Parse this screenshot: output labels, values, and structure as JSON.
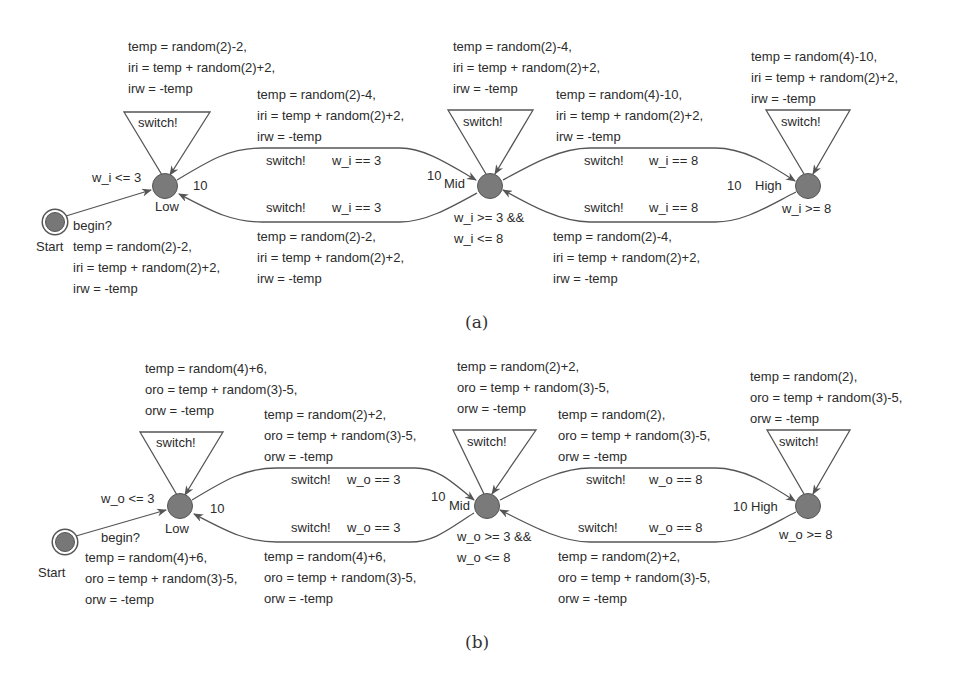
{
  "figure_a": {
    "caption": "(a)",
    "locations": {
      "start": {
        "name": "Start"
      },
      "low": {
        "name": "Low",
        "invariant": "w_i <= 3",
        "rate": "10"
      },
      "mid": {
        "name": "Mid",
        "invariant_1": "w_i >= 3 &&",
        "invariant_2": "w_i <= 8",
        "rate": "10"
      },
      "high": {
        "name": "High",
        "invariant": "w_i >= 8",
        "rate": "10"
      }
    },
    "edges": {
      "start_low": {
        "sync": "begin?",
        "u1": "temp = random(2)-2,",
        "u2": "iri = temp + random(2)+2,",
        "u3": "irw = -temp"
      },
      "low_self": {
        "sync": "switch!",
        "u1": "temp = random(2)-2,",
        "u2": "iri = temp + random(2)+2,",
        "u3": "irw = -temp"
      },
      "low_mid": {
        "sync": "switch!",
        "guard": "w_i == 3",
        "u1": "temp = random(2)-4,",
        "u2": "iri = temp + random(2)+2,",
        "u3": "irw = -temp"
      },
      "mid_low": {
        "sync": "switch!",
        "guard": "w_i == 3",
        "u1": "temp = random(2)-2,",
        "u2": "iri = temp + random(2)+2,",
        "u3": "irw = -temp"
      },
      "mid_self": {
        "sync": "switch!",
        "u1": "temp = random(2)-4,",
        "u2": "iri = temp + random(2)+2,",
        "u3": "irw = -temp"
      },
      "mid_high": {
        "sync": "switch!",
        "guard": "w_i == 8",
        "u1": "temp = random(4)-10,",
        "u2": "iri = temp + random(2)+2,",
        "u3": "irw = -temp"
      },
      "high_mid": {
        "sync": "switch!",
        "guard": "w_i == 8",
        "u1": "temp = random(2)-4,",
        "u2": "iri = temp + random(2)+2,",
        "u3": "irw = -temp"
      },
      "high_self": {
        "sync": "switch!",
        "u1": "temp = random(4)-10,",
        "u2": "iri = temp + random(2)+2,",
        "u3": "irw = -temp"
      }
    }
  },
  "figure_b": {
    "caption": "(b)",
    "locations": {
      "start": {
        "name": "Start"
      },
      "low": {
        "name": "Low",
        "invariant": "w_o <= 3",
        "rate": "10"
      },
      "mid": {
        "name": "Mid",
        "invariant_1": "w_o >= 3 &&",
        "invariant_2": "w_o <= 8",
        "rate": "10"
      },
      "high": {
        "name": "High",
        "invariant": "w_o >= 8",
        "rate": "10"
      }
    },
    "edges": {
      "start_low": {
        "sync": "begin?",
        "u1": "temp = random(4)+6,",
        "u2": "oro = temp + random(3)-5,",
        "u3": "orw = -temp"
      },
      "low_self": {
        "sync": "switch!",
        "u1": "temp = random(4)+6,",
        "u2": "oro = temp + random(3)-5,",
        "u3": "orw = -temp"
      },
      "low_mid": {
        "sync": "switch!",
        "guard": "w_o == 3",
        "u1": "temp = random(2)+2,",
        "u2": "oro = temp + random(3)-5,",
        "u3": "orw = -temp"
      },
      "mid_low": {
        "sync": "switch!",
        "guard": "w_o == 3",
        "u1": "temp = random(4)+6,",
        "u2": "oro = temp + random(3)-5,",
        "u3": "orw = -temp"
      },
      "mid_self": {
        "sync": "switch!",
        "u1": "temp = random(2)+2,",
        "u2": "oro = temp + random(3)-5,",
        "u3": "orw = -temp"
      },
      "mid_high": {
        "sync": "switch!",
        "guard": "w_o == 8",
        "u1": "temp = random(2),",
        "u2": "oro = temp + random(3)-5,",
        "u3": "orw = -temp"
      },
      "high_mid": {
        "sync": "switch!",
        "guard": "w_o == 8",
        "u1": "temp = random(2)+2,",
        "u2": "oro = temp + random(3)-5,",
        "u3": "orw = -temp"
      },
      "high_self": {
        "sync": "switch!",
        "u1": "temp = random(2),",
        "u2": "oro = temp + random(3)-5,",
        "u3": "orw = -temp"
      }
    }
  },
  "colors": {
    "node_fill": "#7a7a7a",
    "edge": "#555555",
    "text": "#2b2b2b"
  }
}
